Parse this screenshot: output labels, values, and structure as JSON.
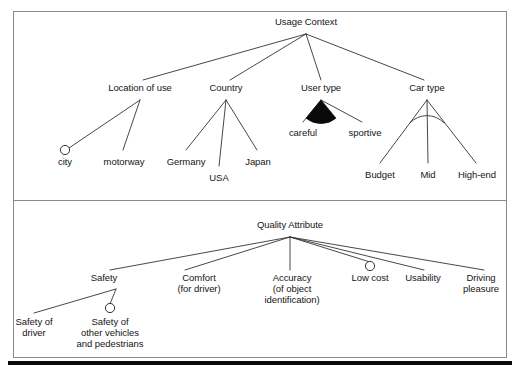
{
  "figure": {
    "type": "feature-model-diagram",
    "notation": {
      "optional_marker": "hollow-circle",
      "alternative_group_marker": "filled-arc",
      "or_group_marker": "hollow-arc"
    },
    "colors": {
      "line": "#333333",
      "text": "#151515",
      "frame": "#8a8a8a",
      "rule": "#000000",
      "fill_dark": "#0a0a0a",
      "background": "#ffffff"
    }
  },
  "panels": [
    {
      "id": "usage-context",
      "root": {
        "label": "Usage Context",
        "x": 306,
        "y": 22
      },
      "nodes": [
        {
          "id": "location-of-use",
          "label": "Location of use",
          "x": 140,
          "y": 88,
          "marker": "none"
        },
        {
          "id": "country",
          "label": "Country",
          "x": 226,
          "y": 88,
          "marker": "none"
        },
        {
          "id": "user-type",
          "label": "User type",
          "x": 321,
          "y": 88,
          "marker": "filled-arc"
        },
        {
          "id": "car-type",
          "label": "Car type",
          "x": 427,
          "y": 88,
          "marker": "hollow-arc"
        },
        {
          "id": "city",
          "label": "city",
          "x": 65,
          "y": 160,
          "marker": "hollow-circle"
        },
        {
          "id": "motorway",
          "label": "motorway",
          "x": 124,
          "y": 160,
          "marker": "none"
        },
        {
          "id": "germany",
          "label": "Germany",
          "x": 186,
          "y": 160,
          "marker": "none"
        },
        {
          "id": "usa",
          "label": "USA",
          "x": 219,
          "y": 176,
          "marker": "none"
        },
        {
          "id": "japan",
          "label": "Japan",
          "x": 258,
          "y": 160,
          "marker": "none"
        },
        {
          "id": "careful",
          "label": "careful",
          "x": 303,
          "y": 131,
          "marker": "none"
        },
        {
          "id": "sportive",
          "label": "sportive",
          "x": 364,
          "y": 131,
          "marker": "none"
        },
        {
          "id": "budget",
          "label": "Budget",
          "x": 380,
          "y": 173,
          "marker": "none"
        },
        {
          "id": "mid",
          "label": "Mid",
          "x": 428,
          "y": 173,
          "marker": "none"
        },
        {
          "id": "high-end",
          "label": "High-end",
          "x": 477,
          "y": 173,
          "marker": "none"
        }
      ],
      "edges": [
        {
          "from": "usage-context",
          "to": "location-of-use"
        },
        {
          "from": "usage-context",
          "to": "country"
        },
        {
          "from": "usage-context",
          "to": "user-type"
        },
        {
          "from": "usage-context",
          "to": "car-type"
        },
        {
          "from": "location-of-use",
          "to": "city"
        },
        {
          "from": "location-of-use",
          "to": "motorway"
        },
        {
          "from": "country",
          "to": "germany"
        },
        {
          "from": "country",
          "to": "usa"
        },
        {
          "from": "country",
          "to": "japan"
        },
        {
          "from": "user-type",
          "to": "careful"
        },
        {
          "from": "user-type",
          "to": "sportive"
        },
        {
          "from": "car-type",
          "to": "budget"
        },
        {
          "from": "car-type",
          "to": "mid"
        },
        {
          "from": "car-type",
          "to": "high-end"
        }
      ]
    },
    {
      "id": "quality-attribute",
      "root": {
        "label": "Quality Attribute",
        "x": 290,
        "y": 225
      },
      "nodes": [
        {
          "id": "safety",
          "label": "Safety",
          "x": 104,
          "y": 278,
          "marker": "none"
        },
        {
          "id": "comfort",
          "label": "Comfort\n(for driver)",
          "x": 199,
          "y": 278,
          "marker": "none"
        },
        {
          "id": "accuracy",
          "label": "Accuracy\n(of object\nidentification)",
          "x": 292,
          "y": 278,
          "marker": "none"
        },
        {
          "id": "low-cost",
          "label": "Low cost",
          "x": 370,
          "y": 278,
          "marker": "hollow-circle"
        },
        {
          "id": "usability",
          "label": "Usability",
          "x": 423,
          "y": 278,
          "marker": "none"
        },
        {
          "id": "driving-pleasure",
          "label": "Driving\npleasure",
          "x": 481,
          "y": 278,
          "marker": "none"
        },
        {
          "id": "safety-of-driver",
          "label": "Safety of\ndriver",
          "x": 34,
          "y": 322,
          "marker": "none"
        },
        {
          "id": "safety-of-others",
          "label": "Safety of\nother vehicles\nand pedestrians",
          "x": 110,
          "y": 322,
          "marker": "hollow-circle"
        }
      ],
      "edges": [
        {
          "from": "quality-attribute",
          "to": "safety"
        },
        {
          "from": "quality-attribute",
          "to": "comfort"
        },
        {
          "from": "quality-attribute",
          "to": "accuracy"
        },
        {
          "from": "quality-attribute",
          "to": "low-cost"
        },
        {
          "from": "quality-attribute",
          "to": "usability"
        },
        {
          "from": "quality-attribute",
          "to": "driving-pleasure"
        },
        {
          "from": "safety",
          "to": "safety-of-driver"
        },
        {
          "from": "safety",
          "to": "safety-of-others"
        }
      ]
    }
  ],
  "labels": {
    "usage_context": "Usage Context",
    "location_of_use": "Location of use",
    "country": "Country",
    "user_type": "User type",
    "car_type": "Car type",
    "city": "city",
    "motorway": "motorway",
    "germany": "Germany",
    "usa": "USA",
    "japan": "Japan",
    "careful": "careful",
    "sportive": "sportive",
    "budget": "Budget",
    "mid": "Mid",
    "high_end": "High-end",
    "quality_attribute": "Quality Attribute",
    "safety": "Safety",
    "comfort": "Comfort\n(for driver)",
    "accuracy": "Accuracy\n(of object\nidentification)",
    "low_cost": "Low cost",
    "usability": "Usability",
    "driving_pleasure": "Driving\npleasure",
    "safety_of_driver": "Safety of\ndriver",
    "safety_of_others": "Safety of\nother vehicles\nand pedestrians"
  }
}
